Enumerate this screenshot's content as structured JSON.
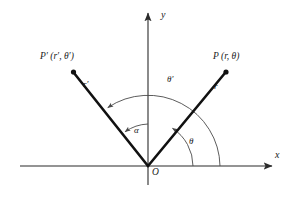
{
  "figure": {
    "background_color": "#ffffff",
    "ink_color": "#1a1a1a",
    "axis_color": "#2b2b2b",
    "arc_color": "#4a4a4a",
    "ray_color": "#111111"
  },
  "axes": {
    "x_label": "x",
    "y_label": "y",
    "origin_label": "O",
    "x_axis": {
      "x1": 20,
      "y1": 166,
      "x2": 272,
      "y2": 166
    },
    "y_axis": {
      "x1": 148,
      "y1": 185,
      "x2": 148,
      "y2": 12
    }
  },
  "points": [
    {
      "name": "P-prime",
      "label": "P′ (r′, θ′)",
      "label_x": 40,
      "label_y": 52,
      "dot_x": 73,
      "dot_y": 72,
      "radius_label": "r′",
      "radius_label_x": 83,
      "radius_label_y": 82,
      "angle_deg": 123
    },
    {
      "name": "P",
      "label": "P (r, θ)",
      "label_x": 213,
      "label_y": 52,
      "dot_x": 226,
      "dot_y": 72,
      "radius_label": "r",
      "radius_label_x": 214,
      "radius_label_y": 84,
      "angle_deg": 57
    }
  ],
  "arcs": [
    {
      "name": "theta-prime-arc",
      "label": "θ′",
      "label_x": 168,
      "label_y": 78,
      "radius": 72,
      "start_deg": 0,
      "end_deg": 123,
      "description": "large arc from positive x-axis to ray OP-prime"
    },
    {
      "name": "theta-arc",
      "label": "θ",
      "label_x": 190,
      "label_y": 140,
      "radius": 45,
      "start_deg": 0,
      "end_deg": 57,
      "description": "medium arc from positive x-axis to ray OP"
    },
    {
      "name": "alpha-arc",
      "label": "α",
      "label_x": 134,
      "label_y": 127,
      "radius": 42,
      "start_deg": 90,
      "end_deg": 123,
      "description": "small arc from positive y-axis to ray OP-prime"
    }
  ],
  "origin": {
    "x": 148,
    "y": 166
  }
}
